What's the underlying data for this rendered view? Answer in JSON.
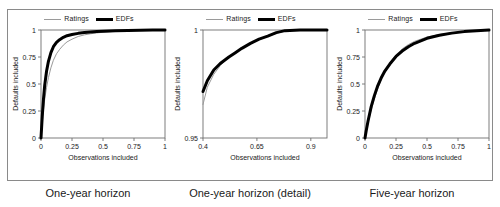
{
  "figure": {
    "panels": [
      {
        "caption": "One-year horizon",
        "legend": [
          {
            "label": "Ratings",
            "style": "thin-gray-line",
            "color": "#9a9a9a"
          },
          {
            "label": "EDFs",
            "style": "thick-black-line",
            "color": "#000000"
          }
        ],
        "chart_data": {
          "type": "line",
          "title": "One-year horizon",
          "xlabel": "Observations included",
          "ylabel": "Defaults included",
          "xlim": [
            0,
            1
          ],
          "ylim": [
            0,
            1
          ],
          "xticks": [
            0,
            0.25,
            0.5,
            0.75,
            1
          ],
          "xticklabels": [
            "0",
            "0.25",
            "0.5",
            "0.75",
            "1"
          ],
          "yticks": [
            0,
            0.25,
            0.5,
            0.75,
            1
          ],
          "yticklabels": [
            "0",
            "0.25",
            "0.5",
            "0.75",
            "1"
          ],
          "grid": false,
          "legend_position": "top-center",
          "series": [
            {
              "name": "Ratings",
              "color": "#9a9a9a",
              "linewidth": 1,
              "x": [
                0,
                0.005,
                0.01,
                0.02,
                0.03,
                0.045,
                0.06,
                0.08,
                0.1,
                0.125,
                0.15,
                0.18,
                0.21,
                0.25,
                0.3,
                0.35,
                0.4,
                0.45,
                0.5,
                0.6,
                0.7,
                0.8,
                0.9,
                1
              ],
              "y": [
                0,
                0.07,
                0.14,
                0.26,
                0.36,
                0.47,
                0.56,
                0.65,
                0.72,
                0.78,
                0.82,
                0.86,
                0.89,
                0.915,
                0.94,
                0.955,
                0.965,
                0.973,
                0.979,
                0.988,
                0.993,
                0.996,
                0.999,
                1
              ]
            },
            {
              "name": "EDFs",
              "color": "#000000",
              "linewidth": 3,
              "x": [
                0,
                0.005,
                0.01,
                0.02,
                0.03,
                0.045,
                0.06,
                0.08,
                0.1,
                0.125,
                0.15,
                0.18,
                0.21,
                0.25,
                0.3,
                0.35,
                0.4,
                0.45,
                0.5,
                0.6,
                0.7,
                0.8,
                0.9,
                1
              ],
              "y": [
                0,
                0.1,
                0.2,
                0.36,
                0.49,
                0.62,
                0.71,
                0.79,
                0.845,
                0.885,
                0.91,
                0.932,
                0.947,
                0.958,
                0.969,
                0.976,
                0.981,
                0.985,
                0.988,
                0.993,
                0.996,
                0.998,
                0.999,
                1
              ]
            }
          ]
        }
      },
      {
        "caption": "One-year horizon (detail)",
        "legend": [
          {
            "label": "Ratings",
            "style": "thin-gray-line",
            "color": "#9a9a9a"
          },
          {
            "label": "EDFs",
            "style": "thick-black-line",
            "color": "#000000"
          }
        ],
        "chart_data": {
          "type": "line",
          "title": "One-year horizon (detail)",
          "xlabel": "Observations included",
          "ylabel": "Defaults included",
          "xlim": [
            0.4,
            0.975
          ],
          "ylim": [
            0.95,
            1
          ],
          "xticks": [
            0.4,
            0.65,
            0.9
          ],
          "xticklabels": [
            "0.4",
            "0.65",
            "0.9"
          ],
          "yticks": [
            0.95,
            1
          ],
          "yticklabels": [
            "0.95",
            "1"
          ],
          "grid": false,
          "legend_position": "top-center",
          "series": [
            {
              "name": "Ratings",
              "color": "#9a9a9a",
              "linewidth": 1,
              "x": [
                0.4,
                0.42,
                0.45,
                0.48,
                0.52,
                0.55,
                0.58,
                0.62,
                0.66,
                0.7,
                0.74,
                0.78,
                0.85,
                0.9,
                0.975
              ],
              "y": [
                0.9655,
                0.9735,
                0.9795,
                0.9835,
                0.9875,
                0.9895,
                0.9915,
                0.9935,
                0.9955,
                0.997,
                0.9985,
                0.9995,
                1,
                1,
                1
              ]
            },
            {
              "name": "EDFs",
              "color": "#000000",
              "linewidth": 3,
              "x": [
                0.4,
                0.42,
                0.45,
                0.48,
                0.52,
                0.55,
                0.58,
                0.62,
                0.66,
                0.7,
                0.74,
                0.78,
                0.85,
                0.9,
                0.975
              ],
              "y": [
                0.9715,
                0.9765,
                0.9815,
                0.9845,
                0.9875,
                0.9895,
                0.9915,
                0.9938,
                0.9958,
                0.9972,
                0.9988,
                0.9997,
                1,
                1,
                1
              ]
            }
          ]
        }
      },
      {
        "caption": "Five-year horizon",
        "legend": [
          {
            "label": "Ratings",
            "style": "thin-gray-line",
            "color": "#9a9a9a"
          },
          {
            "label": "EDFs",
            "style": "thick-black-line",
            "color": "#000000"
          }
        ],
        "chart_data": {
          "type": "line",
          "title": "Five-year horizon",
          "xlabel": "Observations included",
          "ylabel": "Defaults included",
          "xlim": [
            0,
            1
          ],
          "ylim": [
            0,
            1
          ],
          "xticks": [
            0,
            0.25,
            0.5,
            0.75,
            1
          ],
          "xticklabels": [
            "0",
            "0.25",
            "0.5",
            "0.75",
            "1"
          ],
          "yticks": [
            0,
            0.25,
            0.5,
            0.75,
            1
          ],
          "yticklabels": [
            "0",
            "0.25",
            "0.5",
            "0.75",
            "1"
          ],
          "grid": false,
          "legend_position": "top-center",
          "series": [
            {
              "name": "Ratings",
              "color": "#9a9a9a",
              "linewidth": 1,
              "x": [
                0,
                0.01,
                0.025,
                0.05,
                0.075,
                0.1,
                0.13,
                0.16,
                0.2,
                0.25,
                0.3,
                0.35,
                0.4,
                0.5,
                0.6,
                0.7,
                0.8,
                0.9,
                1
              ],
              "y": [
                0,
                0.06,
                0.14,
                0.26,
                0.36,
                0.45,
                0.54,
                0.61,
                0.69,
                0.77,
                0.825,
                0.865,
                0.895,
                0.935,
                0.958,
                0.974,
                0.986,
                0.995,
                1
              ]
            },
            {
              "name": "EDFs",
              "color": "#000000",
              "linewidth": 3,
              "x": [
                0,
                0.01,
                0.025,
                0.05,
                0.075,
                0.1,
                0.13,
                0.16,
                0.2,
                0.25,
                0.3,
                0.35,
                0.4,
                0.5,
                0.6,
                0.7,
                0.8,
                0.9,
                1
              ],
              "y": [
                0,
                0.07,
                0.16,
                0.29,
                0.39,
                0.475,
                0.555,
                0.62,
                0.685,
                0.755,
                0.805,
                0.845,
                0.877,
                0.923,
                0.951,
                0.971,
                0.985,
                0.994,
                1
              ]
            }
          ]
        }
      }
    ]
  }
}
